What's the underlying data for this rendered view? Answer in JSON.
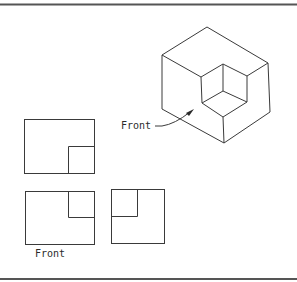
{
  "diagram": {
    "type": "orthographic-projection",
    "colors": {
      "line": "#3a3a3a",
      "border": "#555555",
      "background": "#ffffff"
    },
    "labels": {
      "pictorial_front": "Front",
      "front_view": "Front"
    },
    "pictorial": {
      "outer": {
        "top": [
          207,
          27
        ],
        "left": [
          162,
          55
        ],
        "right": [
          268,
          63
        ],
        "bottom_left": [
          162,
          109
        ],
        "bottom_right": [
          270,
          112
        ],
        "bottom": [
          224,
          143
        ]
      },
      "notch": {
        "back_top": [
          223,
          64
        ],
        "left_top": [
          201,
          77
        ],
        "right_top": [
          247,
          76
        ],
        "center": [
          223,
          91
        ],
        "left_bottom": [
          202,
          103
        ],
        "right_bottom": [
          247,
          102
        ],
        "front_bottom": [
          223,
          117
        ]
      },
      "leader": {
        "start": [
          155,
          126
        ],
        "elbow": [
          162,
          126
        ],
        "tip": [
          193,
          110
        ]
      }
    },
    "views": [
      {
        "name": "top-view",
        "rect": [
          24,
          119,
          70,
          54
        ],
        "notch": [
          68,
          146,
          26,
          27
        ]
      },
      {
        "name": "front-view",
        "rect": [
          25,
          191,
          69,
          53
        ],
        "notch": [
          68,
          191,
          26,
          26
        ]
      },
      {
        "name": "side-view",
        "rect": [
          111,
          189,
          53,
          54
        ],
        "notch": [
          111,
          189,
          26,
          27
        ]
      }
    ]
  }
}
